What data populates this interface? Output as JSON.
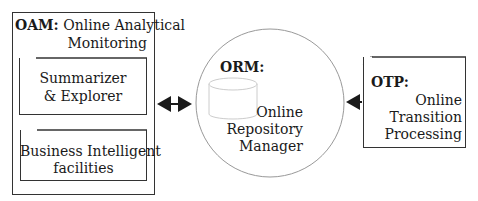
{
  "oam": {
    "title_prefix": "OAM:",
    "title_line1": "Online Analytical",
    "title_line2": "Monitoring",
    "summarizer": {
      "line1": "Summarizer",
      "line2": "& Explorer"
    },
    "business": {
      "line1": "Business Intelligent",
      "line2": "facilities"
    }
  },
  "orm": {
    "title": "ORM:",
    "line1": "Online",
    "line2": "Repository",
    "line3": "Manager"
  },
  "otp": {
    "title": "OTP:",
    "line1": "Online",
    "line2": "Transition",
    "line3": "Processing"
  },
  "edges": [
    {
      "from": "business",
      "to": "summarizer",
      "type": "arrow"
    },
    {
      "from": "oam",
      "to": "orm",
      "type": "bidirectional"
    },
    {
      "from": "otp",
      "to": "orm",
      "type": "arrow"
    }
  ]
}
